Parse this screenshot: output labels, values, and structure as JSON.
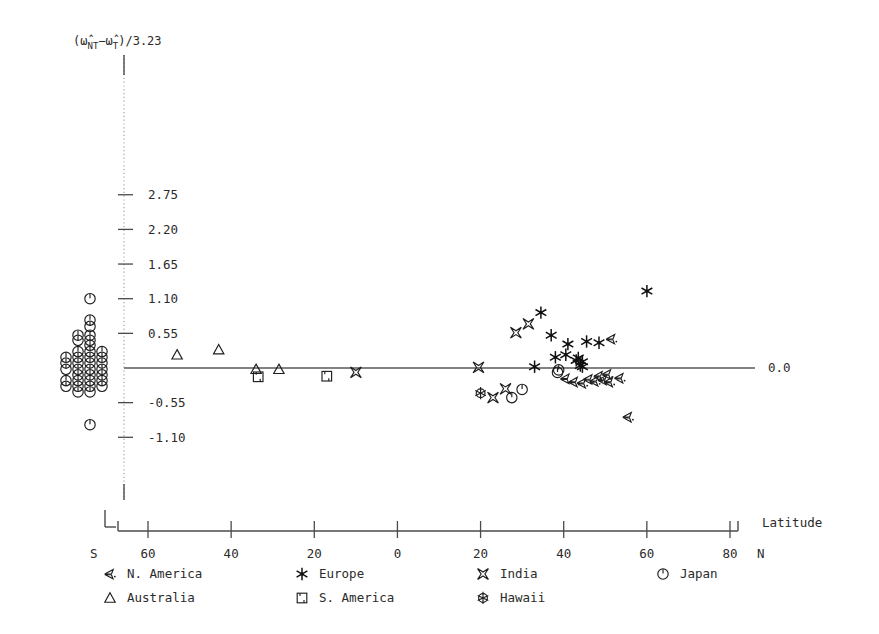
{
  "chart_data": {
    "type": "scatter",
    "title": "",
    "ylabel": "(ω̂NT-ω̂T)/3.23",
    "ylabel_parts": {
      "open_paren": "(",
      "omega1": "ω̂",
      "sub1": "NT",
      "minus": "−",
      "omega2": "ω̂",
      "sub2": "T",
      "close": ")/3.23"
    },
    "xlabel": "Latitude",
    "x_axis_left_hemisphere": "S",
    "x_axis_right_hemisphere": "N",
    "xticks": [
      -60,
      -40,
      -20,
      0,
      20,
      40,
      60,
      80
    ],
    "xticklabels": [
      "60",
      "40",
      "20",
      "0",
      "20",
      "40",
      "60",
      "80"
    ],
    "xlim": [
      -68,
      84
    ],
    "yticks": [
      2.75,
      2.2,
      1.65,
      1.1,
      0.55,
      -0.55,
      -1.1
    ],
    "yticklabels": [
      "2.75",
      "2.20",
      "1.65",
      "1.10",
      "0.55",
      "-0.55",
      "-1.10"
    ],
    "zero_label": "0.0",
    "ylim": [
      -1.45,
      3.1
    ],
    "grid": false,
    "legend_position": "below-axis",
    "series": [
      {
        "name": "N. America",
        "marker": "arrow-left",
        "points": [
          [
            40.5,
            -0.17
          ],
          [
            42.5,
            -0.22
          ],
          [
            44.5,
            -0.24
          ],
          [
            46.0,
            -0.18
          ],
          [
            47.5,
            -0.21
          ],
          [
            48.5,
            -0.13
          ],
          [
            49.5,
            -0.19
          ],
          [
            50.5,
            -0.1
          ],
          [
            51.0,
            -0.22
          ],
          [
            53.5,
            -0.16
          ],
          [
            55.5,
            -0.78
          ],
          [
            51.5,
            0.46
          ]
        ]
      },
      {
        "name": "Europe",
        "marker": "asterisk",
        "points": [
          [
            34.5,
            0.88
          ],
          [
            37.0,
            0.52
          ],
          [
            38.0,
            0.17
          ],
          [
            40.5,
            0.21
          ],
          [
            41.0,
            0.38
          ],
          [
            43.0,
            0.12
          ],
          [
            43.5,
            0.16
          ],
          [
            44.0,
            0.04
          ],
          [
            44.5,
            0.02
          ],
          [
            44.5,
            0.1
          ],
          [
            45.5,
            0.42
          ],
          [
            48.5,
            0.4
          ],
          [
            60.0,
            1.22
          ],
          [
            33.0,
            0.02
          ]
        ]
      },
      {
        "name": "India",
        "marker": "bowtie",
        "points": [
          [
            -10.0,
            -0.07
          ],
          [
            19.5,
            0.01
          ],
          [
            26.0,
            -0.33
          ],
          [
            28.5,
            0.56
          ],
          [
            31.5,
            0.7
          ],
          [
            23.0,
            -0.47
          ]
        ]
      },
      {
        "name": "Japan",
        "marker": "clock",
        "points": [
          [
            30.0,
            -0.34
          ],
          [
            27.5,
            -0.47
          ],
          [
            38.5,
            -0.07
          ],
          [
            38.8,
            -0.03
          ]
        ]
      },
      {
        "name": "Australia",
        "marker": "triangle",
        "points": [
          [
            -53.0,
            0.21
          ],
          [
            -43.0,
            0.29
          ],
          [
            -34.0,
            -0.02
          ],
          [
            -28.5,
            -0.02
          ]
        ]
      },
      {
        "name": "S. America",
        "marker": "square",
        "points": [
          [
            -33.5,
            -0.14
          ],
          [
            -17.0,
            -0.13
          ]
        ]
      },
      {
        "name": "Hawaii",
        "marker": "flower",
        "points": [
          [
            20.0,
            -0.4
          ]
        ]
      }
    ],
    "japan_column": {
      "note": "Dense stacked cluster of Japan markers left of the y-axis",
      "marker": "clock",
      "column_x_px": [
        66,
        78,
        90,
        102
      ],
      "rows": [
        {
          "y": 1.1,
          "cols": [
            2
          ]
        },
        {
          "y": 0.76,
          "cols": [
            2
          ]
        },
        {
          "y": 0.66,
          "cols": [
            2
          ]
        },
        {
          "y": 0.52,
          "cols": [
            1,
            2
          ]
        },
        {
          "y": 0.44,
          "cols": [
            1,
            2
          ]
        },
        {
          "y": 0.36,
          "cols": [
            2
          ]
        },
        {
          "y": 0.26,
          "cols": [
            1,
            2,
            3
          ]
        },
        {
          "y": 0.17,
          "cols": [
            0,
            1,
            2,
            3
          ]
        },
        {
          "y": 0.08,
          "cols": [
            0,
            1,
            2,
            3
          ]
        },
        {
          "y": -0.02,
          "cols": [
            0,
            1,
            2,
            3
          ]
        },
        {
          "y": -0.11,
          "cols": [
            1,
            2,
            3
          ]
        },
        {
          "y": -0.2,
          "cols": [
            0,
            1,
            2,
            3
          ]
        },
        {
          "y": -0.29,
          "cols": [
            0,
            1,
            2,
            3
          ]
        },
        {
          "y": -0.38,
          "cols": [
            1,
            2
          ]
        },
        {
          "y": -0.9,
          "cols": [
            2
          ]
        }
      ]
    }
  },
  "legend": {
    "items": [
      {
        "label": "N. America",
        "marker": "arrow-left"
      },
      {
        "label": "Europe",
        "marker": "asterisk"
      },
      {
        "label": "India",
        "marker": "bowtie"
      },
      {
        "label": "Japan",
        "marker": "clock"
      },
      {
        "label": "Australia",
        "marker": "triangle"
      },
      {
        "label": "S. America",
        "marker": "square"
      },
      {
        "label": "Hawaii",
        "marker": "flower"
      }
    ]
  },
  "colors": {
    "background": "#ffffff",
    "ink": "#2b2b2b",
    "axis": "#4a4a4a",
    "marker": "#1e1e1e"
  }
}
